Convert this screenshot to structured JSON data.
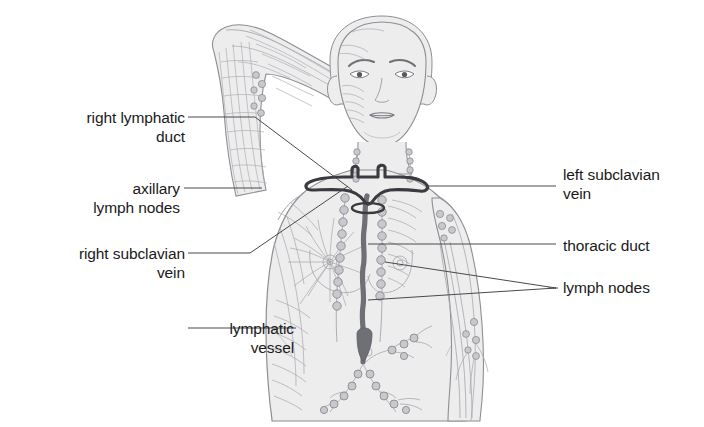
{
  "figure": {
    "width": 704,
    "height": 427,
    "background_color": "#ffffff"
  },
  "labels": {
    "left": [
      {
        "id": "right-lymphatic-duct",
        "text": "right lymphatic\nduct",
        "leader": "diagonal",
        "color": "#1a1a1a"
      },
      {
        "id": "axillary-lymph-nodes",
        "text": "axillary\nlymph nodes",
        "leader": "horizontal",
        "color": "#1a1a1a"
      },
      {
        "id": "right-subclavian-vein",
        "text": "right subclavian\nvein",
        "leader": "diagonal",
        "color": "#1a1a1a"
      },
      {
        "id": "lymphatic-vessel",
        "text": "lymphatic\nvessel",
        "leader": "horizontal",
        "color": "#1a1a1a"
      }
    ],
    "right": [
      {
        "id": "left-subclavian-vein",
        "text": "left subclavian\nvein",
        "leader": "horizontal",
        "color": "#1a1a1a"
      },
      {
        "id": "thoracic-duct",
        "text": "thoracic duct",
        "leader": "horizontal",
        "color": "#1a1a1a"
      },
      {
        "id": "lymph-nodes",
        "text": "lymph nodes",
        "leader": "forked",
        "color": "#1a1a1a"
      }
    ]
  },
  "colors": {
    "body_fill": "#ededee",
    "body_outline": "#8e8e94",
    "vessel_line": "#9b9ba1",
    "node_fill": "#c9c9cd",
    "node_stroke": "#8a8a90",
    "duct_dark": "#6f6f76",
    "vein_dark": "#3b3b3f",
    "leader_line": "#4a4a4a",
    "text": "#1a1a1a"
  }
}
